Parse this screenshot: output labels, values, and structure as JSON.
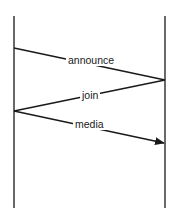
{
  "diagram": {
    "type": "sequence",
    "lifelines": [
      {
        "id": "left",
        "x": 14,
        "y1": 16,
        "y2": 208
      },
      {
        "id": "right",
        "x": 165,
        "y1": 16,
        "y2": 208
      }
    ],
    "messages": [
      {
        "label": "announce",
        "from": "left",
        "to": "right",
        "y1": 48,
        "y2": 80,
        "arrow": false
      },
      {
        "label": "join",
        "from": "right",
        "to": "left",
        "y1": 80,
        "y2": 111,
        "arrow": false
      },
      {
        "label": "media",
        "from": "left",
        "to": "right",
        "y1": 111,
        "y2": 143,
        "arrow": true
      }
    ],
    "stroke_color": "#1a1a1a"
  }
}
